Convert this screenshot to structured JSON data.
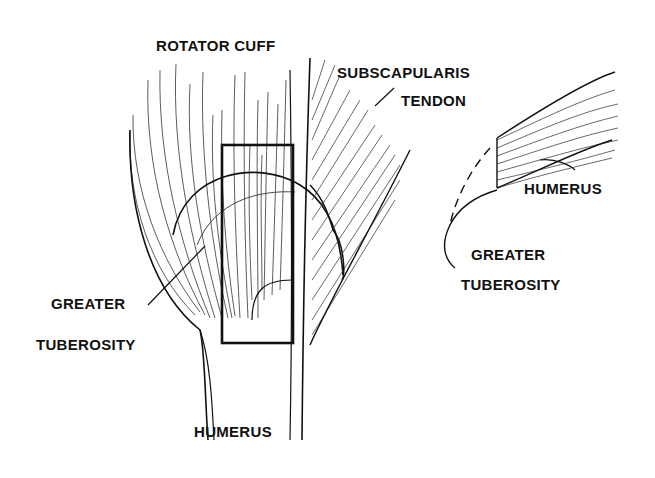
{
  "diagram": {
    "colors": {
      "ink": "#111111",
      "background": "#ffffff",
      "fiber": "#444444"
    },
    "left_view": {
      "labels": {
        "rotator_cuff": "ROTATOR CUFF",
        "greater_tuberosity_line1": "GREATER",
        "greater_tuberosity_line2": "TUBEROSITY",
        "humerus": "HUMERUS"
      }
    },
    "middle_view": {
      "labels": {
        "subscapularis_line1": "SUBSCAPULARIS",
        "subscapularis_line2": "TENDON"
      }
    },
    "right_view": {
      "labels": {
        "humerus": "HUMERUS",
        "greater_tuberosity_line1": "GREATER",
        "greater_tuberosity_line2": "TUBEROSITY"
      }
    }
  }
}
